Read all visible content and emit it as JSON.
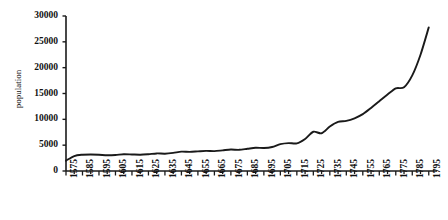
{
  "chart_data": {
    "type": "line",
    "title": "",
    "subtitle": "",
    "xlabel": "",
    "ylabel": "population",
    "xlim": [
      1575,
      1800
    ],
    "ylim": [
      0,
      30000
    ],
    "grid": false,
    "legend": "none",
    "y_ticks": [
      0,
      5000,
      10000,
      15000,
      20000,
      25000,
      30000
    ],
    "y_tick_labels": [
      "0",
      "5000",
      "10000",
      "15000",
      "20000",
      "25000",
      "30000"
    ],
    "x_tick_labels": [
      "1575",
      "1585",
      "1595",
      "1605",
      "1615",
      "1625",
      "1635",
      "1645",
      "1655",
      "1665",
      "1675",
      "1685",
      "1695",
      "1705",
      "1715",
      "1725",
      "1735",
      "1745",
      "1755",
      "1765",
      "1775",
      "1785",
      "1795"
    ],
    "x_minor_tick_interval": 5,
    "x_major_tick_interval": 10,
    "line_color": "#1a1a1a",
    "axis_color": "#1a1a1a",
    "x": [
      1575,
      1580,
      1585,
      1590,
      1595,
      1600,
      1605,
      1610,
      1615,
      1620,
      1625,
      1630,
      1635,
      1640,
      1645,
      1650,
      1655,
      1660,
      1665,
      1670,
      1675,
      1680,
      1685,
      1690,
      1695,
      1700,
      1705,
      1710,
      1715,
      1720,
      1725,
      1730,
      1735,
      1740,
      1745,
      1750,
      1755,
      1760,
      1765,
      1770,
      1775,
      1780,
      1785,
      1790,
      1795
    ],
    "values": [
      2000,
      2900,
      3150,
      3200,
      3150,
      3050,
      3100,
      3250,
      3200,
      3150,
      3250,
      3400,
      3350,
      3500,
      3750,
      3700,
      3800,
      3900,
      3850,
      4000,
      4150,
      4100,
      4300,
      4500,
      4450,
      4650,
      5200,
      5400,
      5350,
      6200,
      7600,
      7300,
      8600,
      9500,
      9700,
      10200,
      11000,
      12200,
      13500,
      14800,
      16000,
      16200,
      18500,
      22500,
      27800
    ]
  }
}
